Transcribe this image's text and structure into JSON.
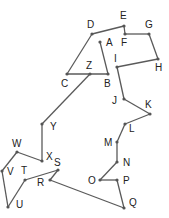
{
  "diagram": {
    "type": "connect-the-dots",
    "line_color": "#5a5a5a",
    "dot_color": "#555555",
    "label_color": "#222222",
    "points": [
      {
        "id": "A",
        "x": 100,
        "y": 42,
        "lx": 106,
        "ly": 46
      },
      {
        "id": "B",
        "x": 108,
        "y": 74,
        "lx": 104,
        "ly": 87
      },
      {
        "id": "C",
        "x": 67,
        "y": 74,
        "lx": 61,
        "ly": 87
      },
      {
        "id": "D",
        "x": 92,
        "y": 34,
        "lx": 87,
        "ly": 28
      },
      {
        "id": "E",
        "x": 124,
        "y": 26,
        "lx": 120,
        "ly": 19
      },
      {
        "id": "F",
        "x": 125,
        "y": 34,
        "lx": 121,
        "ly": 46
      },
      {
        "id": "G",
        "x": 149,
        "y": 34,
        "lx": 145,
        "ly": 28
      },
      {
        "id": "H",
        "x": 158,
        "y": 59,
        "lx": 155,
        "ly": 71
      },
      {
        "id": "I",
        "x": 117,
        "y": 67,
        "lx": 114,
        "ly": 62
      },
      {
        "id": "J",
        "x": 124,
        "y": 99,
        "lx": 112,
        "ly": 104
      },
      {
        "id": "K",
        "x": 150,
        "y": 114,
        "lx": 145,
        "ly": 108
      },
      {
        "id": "L",
        "x": 125,
        "y": 124,
        "lx": 129,
        "ly": 132
      },
      {
        "id": "M",
        "x": 117,
        "y": 142,
        "lx": 104,
        "ly": 146
      },
      {
        "id": "N",
        "x": 117,
        "y": 162,
        "lx": 123,
        "ly": 166
      },
      {
        "id": "O",
        "x": 100,
        "y": 180,
        "lx": 88,
        "ly": 184
      },
      {
        "id": "P",
        "x": 117,
        "y": 180,
        "lx": 123,
        "ly": 184
      },
      {
        "id": "Q",
        "x": 124,
        "y": 208,
        "lx": 129,
        "ly": 206
      },
      {
        "id": "R",
        "x": 50,
        "y": 180,
        "lx": 37,
        "ly": 186
      },
      {
        "id": "S",
        "x": 58,
        "y": 170,
        "lx": 54,
        "ly": 166
      },
      {
        "id": "T",
        "x": 25,
        "y": 180,
        "lx": 21,
        "ly": 174
      },
      {
        "id": "U",
        "x": 8,
        "y": 207,
        "lx": 16,
        "ly": 208
      },
      {
        "id": "V",
        "x": 2,
        "y": 171,
        "lx": 7,
        "ly": 175
      },
      {
        "id": "W",
        "x": 17,
        "y": 152,
        "lx": 12,
        "ly": 147
      },
      {
        "id": "X",
        "x": 42,
        "y": 161,
        "lx": 46,
        "ly": 160
      },
      {
        "id": "Y",
        "x": 42,
        "y": 124,
        "lx": 50,
        "ly": 130
      },
      {
        "id": "Z",
        "x": 90,
        "y": 74,
        "lx": 86,
        "ly": 69
      }
    ],
    "segments": [
      [
        "A",
        "B"
      ],
      [
        "B",
        "C"
      ],
      [
        "C",
        "D"
      ],
      [
        "D",
        "E"
      ],
      [
        "E",
        "F"
      ],
      [
        "F",
        "G"
      ],
      [
        "G",
        "H"
      ],
      [
        "H",
        "I"
      ],
      [
        "I",
        "J"
      ],
      [
        "J",
        "K"
      ],
      [
        "K",
        "L"
      ],
      [
        "L",
        "M"
      ],
      [
        "M",
        "N"
      ],
      [
        "N",
        "O"
      ],
      [
        "O",
        "P"
      ],
      [
        "P",
        "Q"
      ],
      [
        "Q",
        "R"
      ],
      [
        "R",
        "S"
      ],
      [
        "S",
        "T"
      ],
      [
        "T",
        "U"
      ],
      [
        "U",
        "V"
      ],
      [
        "V",
        "W"
      ],
      [
        "W",
        "X"
      ],
      [
        "X",
        "Y"
      ],
      [
        "Y",
        "Z"
      ]
    ]
  }
}
